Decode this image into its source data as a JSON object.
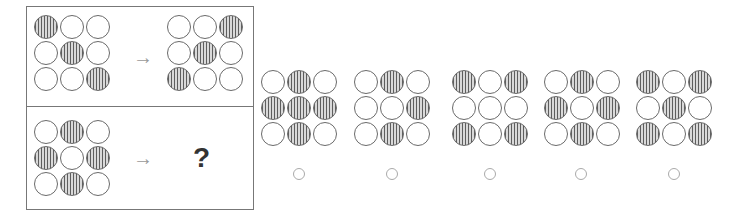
{
  "question": {
    "example": {
      "source": [
        [
          1,
          0,
          0
        ],
        [
          0,
          1,
          0
        ],
        [
          0,
          0,
          1
        ]
      ],
      "result": [
        [
          0,
          0,
          1
        ],
        [
          0,
          1,
          0
        ],
        [
          1,
          0,
          0
        ]
      ],
      "arrow": "→"
    },
    "query": {
      "source": [
        [
          0,
          1,
          0
        ],
        [
          1,
          0,
          1
        ],
        [
          0,
          1,
          0
        ]
      ],
      "arrow": "→",
      "unknown": "?"
    }
  },
  "options": [
    {
      "id": "A",
      "grid": [
        [
          0,
          1,
          0
        ],
        [
          1,
          1,
          1
        ],
        [
          0,
          1,
          0
        ]
      ]
    },
    {
      "id": "B",
      "grid": [
        [
          0,
          1,
          0
        ],
        [
          0,
          0,
          1
        ],
        [
          0,
          1,
          0
        ]
      ]
    },
    {
      "id": "C",
      "grid": [
        [
          1,
          0,
          1
        ],
        [
          0,
          0,
          0
        ],
        [
          1,
          0,
          1
        ]
      ]
    },
    {
      "id": "D",
      "grid": [
        [
          0,
          1,
          0
        ],
        [
          1,
          0,
          1
        ],
        [
          0,
          1,
          0
        ]
      ]
    },
    {
      "id": "E",
      "grid": [
        [
          1,
          0,
          1
        ],
        [
          0,
          1,
          0
        ],
        [
          1,
          0,
          1
        ]
      ]
    }
  ],
  "colors": {
    "frame": "#777777",
    "circle_outline": "#6a6a6a",
    "stripe_dark": "#5e5e5e",
    "stripe_light": "#d9d9d9",
    "arrow": "#999999",
    "radio": "#aaaaaa"
  }
}
